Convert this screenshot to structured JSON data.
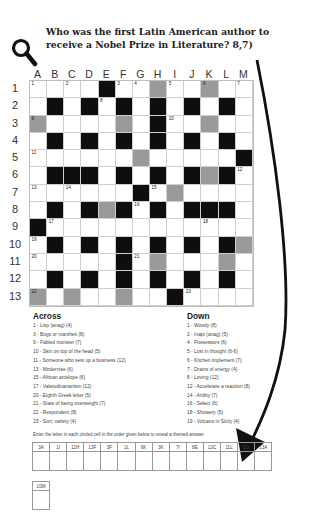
{
  "question": "Who was the first Latin American author to receive a Nobel Prize in Literature? 8,7)",
  "icons": {
    "magnifier": "magnifying-glass-icon",
    "arrow": "curved-arrow-icon"
  },
  "colors": {
    "black_cell": "#0e0e0e",
    "gray_cell": "#9a9a9a",
    "white_cell": "#ffffff"
  },
  "grid": {
    "columns": [
      "A",
      "B",
      "C",
      "D",
      "E",
      "F",
      "G",
      "H",
      "I",
      "J",
      "K",
      "L",
      "M"
    ],
    "rows": [
      "1",
      "2",
      "3",
      "4",
      "5",
      "6",
      "7",
      "8",
      "9",
      "10",
      "11",
      "12",
      "13"
    ],
    "legend": {
      ".": "white",
      "#": "black",
      "g": "gray (circled)"
    },
    "layout": [
      "....#..g..g..",
      ".#.#.#.#.#.#.",
      "g....g.#..g..",
      ".#.#.#.#.#.#.",
      "......g.....#",
      ".###.#.#.#g#.",
      "......#.g....",
      ".#.#g#.#.###.",
      "#............",
      ".#.#.#.#.#.#g",
      ".....#.g...g.",
      ".#.#.#.#.#.#.",
      "g.g..g..#...."
    ],
    "numbers": [
      {
        "n": "1",
        "r": 0,
        "c": 0
      },
      {
        "n": "2",
        "r": 0,
        "c": 2
      },
      {
        "n": "3",
        "r": 0,
        "c": 5
      },
      {
        "n": "4",
        "r": 0,
        "c": 6
      },
      {
        "n": "5",
        "r": 0,
        "c": 8
      },
      {
        "n": "6",
        "r": 0,
        "c": 10
      },
      {
        "n": "7",
        "r": 0,
        "c": 12
      },
      {
        "n": "8",
        "r": 1,
        "c": 4
      },
      {
        "n": "9",
        "r": 2,
        "c": 0
      },
      {
        "n": "10",
        "r": 2,
        "c": 8
      },
      {
        "n": "11",
        "r": 4,
        "c": 0
      },
      {
        "n": "12",
        "r": 5,
        "c": 12
      },
      {
        "n": "13",
        "r": 6,
        "c": 0
      },
      {
        "n": "14",
        "r": 6,
        "c": 2
      },
      {
        "n": "15",
        "r": 6,
        "c": 7
      },
      {
        "n": "16",
        "r": 7,
        "c": 6
      },
      {
        "n": "17",
        "r": 8,
        "c": 1
      },
      {
        "n": "18",
        "r": 8,
        "c": 10
      },
      {
        "n": "19",
        "r": 9,
        "c": 0
      },
      {
        "n": "20",
        "r": 10,
        "c": 0
      },
      {
        "n": "21",
        "r": 10,
        "c": 6
      },
      {
        "n": "22",
        "r": 12,
        "c": 0
      },
      {
        "n": "23",
        "r": 12,
        "c": 9
      }
    ]
  },
  "across": {
    "heading": "Across",
    "clues": [
      "1 - Lisp (anag) (4)",
      "3 - Bogs or marshes (8)",
      "9 - Fabled monster (7)",
      "10 - Skin on top of the head (5)",
      "11 - Someone who sets up a business (12)",
      "13 - Modernise (6)",
      "15 - African antelope (6)",
      "17 - Valetudinarianism (12)",
      "20 - Eighth Greek letter (5)",
      "21 - State of being overweight (7)",
      "22 - Respondent (8)",
      "23 - Sort; variety (4)"
    ]
  },
  "down": {
    "heading": "Down",
    "clues": [
      "1 - Woody (8)",
      "2 - Inapt (anag) (5)",
      "4 - Possessors (6)",
      "5 - Lost in thought (6-6)",
      "6 - Kitchen implement (7)",
      "7 - Drains of energy (4)",
      "8 - Loving (12)",
      "12 - Accelerate a reaction (8)",
      "14 - Aridity (7)",
      "16 - Select (6)",
      "18 - Showery (5)",
      "19 - Volcano in Sicily (4)"
    ]
  },
  "instructions": "Enter the letter in each circled cell in the order given below to reveal a themed answer.",
  "answer_cells": [
    "3A",
    "1I",
    "11H",
    "13F",
    "3F",
    "1L",
    "6K",
    "3K",
    "7I",
    "8E",
    "13C",
    "11L",
    "5G",
    "13A"
  ],
  "answer_cells_row2": [
    "10M"
  ]
}
